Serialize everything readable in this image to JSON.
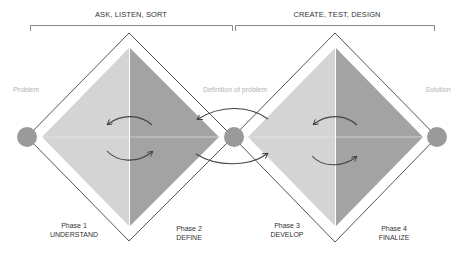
{
  "brackets": [
    {
      "title": "ASK, LISTEN, SORT"
    },
    {
      "title": "CREATE, TEST, DESIGN"
    }
  ],
  "nodes": {
    "start": "Problem",
    "middle": "Definition of problem",
    "end": "Solution"
  },
  "phases": [
    {
      "number": "Phase 1",
      "name": "UNDERSTAND"
    },
    {
      "number": "Phase 2",
      "name": "DEFINE"
    },
    {
      "number": "Phase 3",
      "name": "DEVELOP"
    },
    {
      "number": "Phase 4",
      "name": "FINALIZE"
    }
  ],
  "colors": {
    "outline": "#555555",
    "fill_light": "#d4d4d4",
    "fill_dark": "#a3a3a3",
    "circle": "#9a9a9a",
    "arrow": "#444444",
    "bracket": "#888888"
  }
}
